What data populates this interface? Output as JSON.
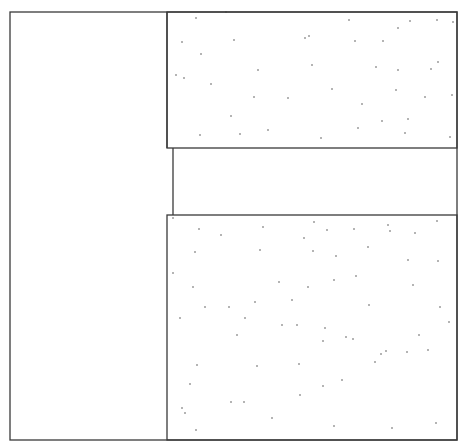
{
  "canvas": {
    "width": 473,
    "height": 446,
    "background": "#ffffff"
  },
  "style": {
    "stroke": "#3a3a3a",
    "stroke_width": 1.3,
    "dot_color": "#555555",
    "dot_radius": 0.8
  },
  "outer_frame": {
    "x": 10,
    "y": 12,
    "w": 447,
    "h": 428
  },
  "regions": [
    {
      "id": "left-panel",
      "x": 10,
      "y": 12,
      "w": 157,
      "h": 428,
      "stippled": false
    },
    {
      "id": "upper-block",
      "x": 167,
      "y": 12,
      "w": 290,
      "h": 136,
      "stippled": true
    },
    {
      "id": "middle-gap",
      "x": 173,
      "y": 148,
      "w": 284,
      "h": 67,
      "stippled": false
    },
    {
      "id": "lower-block",
      "x": 167,
      "y": 215,
      "w": 290,
      "h": 225,
      "stippled": true
    }
  ],
  "stipple": {
    "upper-block": [
      [
        196,
        18
      ],
      [
        226,
        12
      ],
      [
        234,
        40
      ],
      [
        305,
        38
      ],
      [
        182,
        42
      ],
      [
        201,
        54
      ],
      [
        349,
        20
      ],
      [
        312,
        65
      ],
      [
        355,
        41
      ],
      [
        176,
        75
      ],
      [
        184,
        78
      ],
      [
        211,
        84
      ],
      [
        258,
        70
      ],
      [
        398,
        28
      ],
      [
        437,
        20
      ],
      [
        410,
        21
      ],
      [
        453,
        22
      ],
      [
        309,
        36
      ],
      [
        383,
        41
      ],
      [
        376,
        67
      ],
      [
        398,
        70
      ],
      [
        431,
        69
      ],
      [
        396,
        90
      ],
      [
        332,
        89
      ],
      [
        362,
        104
      ],
      [
        254,
        97
      ],
      [
        288,
        98
      ],
      [
        425,
        97
      ],
      [
        231,
        116
      ],
      [
        382,
        121
      ],
      [
        408,
        119
      ],
      [
        452,
        95
      ],
      [
        200,
        135
      ],
      [
        240,
        134
      ],
      [
        268,
        130
      ],
      [
        321,
        138
      ],
      [
        405,
        133
      ],
      [
        450,
        137
      ],
      [
        358,
        128
      ],
      [
        438,
        62
      ]
    ],
    "lower-block": [
      [
        173,
        218
      ],
      [
        199,
        229
      ],
      [
        221,
        235
      ],
      [
        263,
        227
      ],
      [
        314,
        222
      ],
      [
        327,
        230
      ],
      [
        313,
        251
      ],
      [
        354,
        229
      ],
      [
        388,
        225
      ],
      [
        390,
        231
      ],
      [
        415,
        233
      ],
      [
        437,
        221
      ],
      [
        195,
        252
      ],
      [
        260,
        250
      ],
      [
        336,
        256
      ],
      [
        368,
        247
      ],
      [
        408,
        260
      ],
      [
        173,
        273
      ],
      [
        193,
        287
      ],
      [
        229,
        307
      ],
      [
        255,
        302
      ],
      [
        292,
        300
      ],
      [
        308,
        287
      ],
      [
        356,
        276
      ],
      [
        279,
        282
      ],
      [
        334,
        280
      ],
      [
        413,
        285
      ],
      [
        438,
        261
      ],
      [
        245,
        318
      ],
      [
        205,
        307
      ],
      [
        180,
        318
      ],
      [
        369,
        305
      ],
      [
        449,
        322
      ],
      [
        237,
        335
      ],
      [
        282,
        325
      ],
      [
        297,
        325
      ],
      [
        323,
        341
      ],
      [
        299,
        364
      ],
      [
        353,
        339
      ],
      [
        375,
        362
      ],
      [
        197,
        365
      ],
      [
        257,
        366
      ],
      [
        325,
        328
      ],
      [
        346,
        337
      ],
      [
        381,
        354
      ],
      [
        428,
        350
      ],
      [
        244,
        402
      ],
      [
        300,
        395
      ],
      [
        386,
        351
      ],
      [
        407,
        352
      ],
      [
        323,
        386
      ],
      [
        342,
        380
      ],
      [
        190,
        384
      ],
      [
        231,
        402
      ],
      [
        182,
        408
      ],
      [
        185,
        413
      ],
      [
        196,
        430
      ],
      [
        272,
        418
      ],
      [
        334,
        426
      ],
      [
        392,
        428
      ],
      [
        436,
        423
      ],
      [
        419,
        335
      ],
      [
        440,
        307
      ],
      [
        304,
        238
      ]
    ]
  }
}
